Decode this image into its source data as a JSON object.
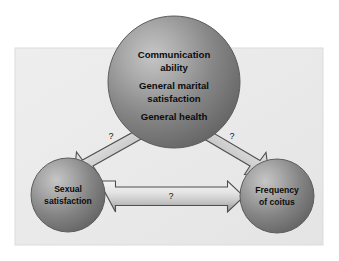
{
  "figure": {
    "type": "conceptual-path-diagram",
    "background_color": "#ffffff",
    "panel_color": "#ebebeb",
    "panel_border_color": "#d8d8d8",
    "node_fill_dark": "#6f6f6f",
    "node_fill_light": "#bdbdbd",
    "arrow_fill_light": "#e2e2e2",
    "arrow_fill_dark": "#9a9a9a",
    "arrow_outline_color": "#5a5a5a",
    "text_color": "#0c0c0c"
  },
  "nodes": {
    "top": {
      "id": "top-node",
      "name": "predictors-node",
      "lines": [
        "Communication",
        "ability",
        "General marital",
        "satisfaction",
        "General health"
      ]
    },
    "bottom_left": {
      "id": "bottom-left-node",
      "name": "sexual-satisfaction-node",
      "lines": [
        "Sexual",
        "satisfaction"
      ]
    },
    "bottom_right": {
      "id": "bottom-right-node",
      "name": "frequency-of-coitus-node",
      "lines": [
        "Frequency",
        "of coitus"
      ]
    }
  },
  "edges": [
    {
      "id": "edge-top-left",
      "name": "arrow-top-to-sexual-satisfaction",
      "from": "top",
      "to": "bottom_left",
      "label": "?",
      "style": "double-headed"
    },
    {
      "id": "edge-top-right",
      "name": "arrow-top-to-frequency-of-coitus",
      "from": "top",
      "to": "bottom_right",
      "label": "?",
      "style": "double-headed"
    },
    {
      "id": "edge-bottom",
      "name": "arrow-sexual-satisfaction-to-frequency-of-coitus",
      "from": "bottom_left",
      "to": "bottom_right",
      "label": "?",
      "style": "double-headed"
    }
  ]
}
